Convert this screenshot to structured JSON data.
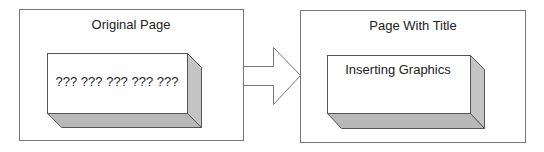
{
  "left_panel": {
    "title": "Original Page",
    "box_text": "??? ??? ??? ??? ???"
  },
  "right_panel": {
    "title": "Page With Title",
    "box_text": "Inserting Graphics"
  },
  "arrow": {
    "direction": "right"
  },
  "colors": {
    "border": "#6e6e6e",
    "box_face": "#ffffff",
    "box_side": "#c4c4c4",
    "box_bottom": "#b8b8b8",
    "text": "#222222"
  }
}
